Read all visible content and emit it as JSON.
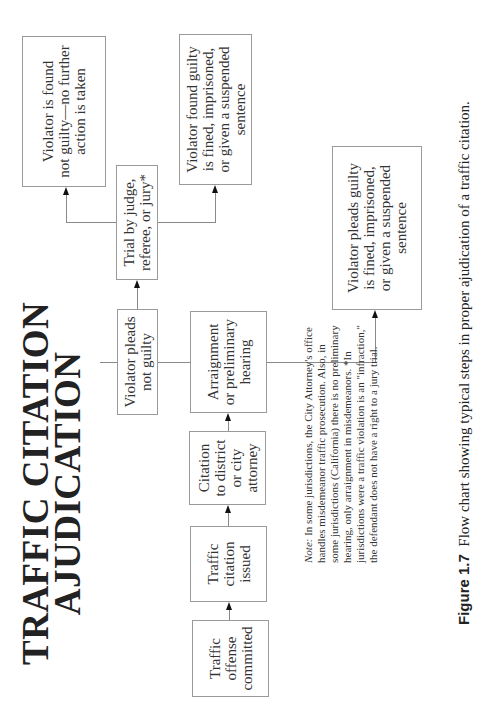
{
  "title": {
    "line1": "TRAFFIC CITATION",
    "line2": "AJUDICATION"
  },
  "boxes": {
    "offense": "Traffic offense committed",
    "issued": "Traffic citation issued",
    "citation_attorney": "Citation to district or city attorney",
    "arraignment": "Arraignment or preliminary hearing",
    "pleads_not_guilty": "Violator pleads not guilty",
    "trial": "Trial by judge, referee, or jury*",
    "found_not_guilty": "Violator is found not guilty—no further action is taken",
    "found_guilty": "Violator found guilty is fined, imprisoned, or given a suspended sentence",
    "pleads_guilty": "Violator pleads guilty is fined, imprisoned, or given a suspended sentence"
  },
  "box_lines": {
    "offense": [
      "Traffic",
      "offense",
      "committed"
    ],
    "issued": [
      "Traffic",
      "citation",
      "issued"
    ],
    "citation_attorney": [
      "Citation",
      "to district",
      "or city",
      "attorney"
    ],
    "arraignment": [
      "Arraignment",
      "or preliminary",
      "hearing"
    ],
    "pleads_not_guilty": [
      "Violator pleads",
      "not guilty"
    ],
    "trial": [
      "Trial by judge,",
      "referee, or jury*"
    ],
    "found_not_guilty": [
      "Violator is found",
      "not guilty—no further",
      "action is taken"
    ],
    "found_guilty": [
      "Violator found guilty",
      "is fined, imprisoned,",
      "or given a suspended",
      "sentence"
    ],
    "pleads_guilty": [
      "Violator pleads guilty",
      "is fined, imprisoned,",
      "or given a suspended",
      "sentence"
    ]
  },
  "note": {
    "label": "Note:",
    "text": "In some jurisdictions, the City Attorney's office handles misdemeanor traffic prosecution. Also, in some jurisdictions (California) there is no preliminary hearing, only arraignment in misdemeanors. *In jurisdictions were a traffic violation is an \"infraction,\" the defendant does not have a right to a jury trial."
  },
  "caption": {
    "figure_label": "Figure 1.7",
    "text": "Flow chart showing typical steps in proper ajudication of a traffic citation."
  }
}
